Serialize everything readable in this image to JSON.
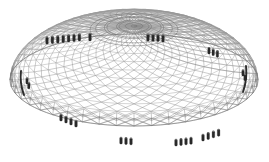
{
  "figure": {
    "title": "",
    "view": "perspective, from above and front-left",
    "background_color": "#ffffff",
    "line_color": "#8d8d8d",
    "dense_line_color": "#6a6a6a",
    "edge_color": "#2c2c2c",
    "support_color": "#2a2a2a",
    "support_highlight_color": "#6d6d6d"
  },
  "geometry": {
    "shell_type": "diagrid",
    "plan_shape": "ellipse",
    "ellipse_center_x": 134,
    "ellipse_center_y": 80,
    "ellipse_radius_x": 124,
    "ellipse_radius_y": 46,
    "dome_rise": 54,
    "grid_u_divisions": 44,
    "grid_v_divisions": 13,
    "perimeter_brace_rings": 2
  },
  "support_groups": [
    {
      "name": "upper-left-ridge",
      "count": 7,
      "x": 47,
      "y": 44,
      "dx": 5.4,
      "dy": -0.5,
      "height": 7.0,
      "width": 2.6,
      "label": "upper left roof supports"
    },
    {
      "name": "upper-left-single",
      "count": 1,
      "x": 90,
      "y": 41,
      "dx": 0,
      "dy": 0,
      "height": 7.5,
      "width": 2.6,
      "label": "upper left isolated support"
    },
    {
      "name": "upper-right-ridge",
      "count": 4,
      "x": 148,
      "y": 41,
      "dx": 5.0,
      "dy": 0.3,
      "height": 6.8,
      "width": 2.6,
      "label": "upper right roof supports"
    },
    {
      "name": "right-shoulder",
      "count": 3,
      "x": 209,
      "y": 54,
      "dx": 4.2,
      "dy": 1.6,
      "height": 6.4,
      "width": 2.4,
      "label": "right shoulder supports"
    },
    {
      "name": "right-edge",
      "count": 2,
      "x": 243,
      "y": 76,
      "dx": 2.0,
      "dy": 4.6,
      "height": 6.0,
      "width": 2.4,
      "label": "right edge supports"
    },
    {
      "name": "left-edge",
      "count": 2,
      "x": 27,
      "y": 84,
      "dx": 1.8,
      "dy": 4.8,
      "height": 6.0,
      "width": 2.4,
      "label": "left edge supports"
    },
    {
      "name": "lower-left",
      "count": 4,
      "x": 61,
      "y": 121,
      "dx": 5.0,
      "dy": 2.0,
      "height": 6.6,
      "width": 2.6,
      "label": "lower left ground supports"
    },
    {
      "name": "bottom-center",
      "count": 3,
      "x": 121,
      "y": 144,
      "dx": 5.0,
      "dy": 0.4,
      "height": 6.6,
      "width": 2.6,
      "label": "bottom centre ground supports"
    },
    {
      "name": "bottom-right-a",
      "count": 4,
      "x": 176,
      "y": 146,
      "dx": 5.0,
      "dy": -0.6,
      "height": 6.6,
      "width": 2.6,
      "label": "bottom right ground supports"
    },
    {
      "name": "bottom-right-b",
      "count": 4,
      "x": 203,
      "y": 141,
      "dx": 5.2,
      "dy": -1.6,
      "height": 6.6,
      "width": 2.6,
      "label": "bottom right outer supports"
    }
  ],
  "dark_edges": [
    {
      "name": "left-rim-edge",
      "x1": 21,
      "y1": 71,
      "x2": 24,
      "y2": 95,
      "label": "left thickened rim"
    },
    {
      "name": "right-rim-edge",
      "x1": 246,
      "y1": 66,
      "x2": 243,
      "y2": 92,
      "label": "right thickened rim"
    }
  ],
  "caption": {
    "text": ""
  }
}
